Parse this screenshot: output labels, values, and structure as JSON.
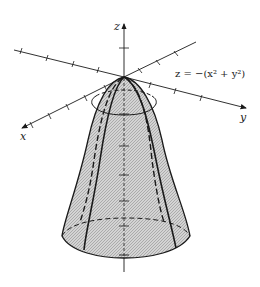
{
  "figure": {
    "equation": "z = −(x² + y²)",
    "axes": {
      "x_label": "x",
      "y_label": "y",
      "z_label": "z"
    },
    "surface": "downward-opening paraboloid",
    "colors": {
      "line": "#1a1a1a",
      "fill": "#c8c8c8",
      "background": "#ffffff"
    }
  }
}
